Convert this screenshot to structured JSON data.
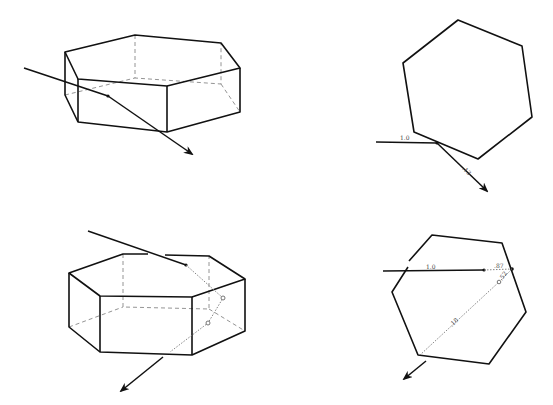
{
  "figure": {
    "panels": [
      {
        "id": "prism-3d-reflection",
        "description": "Ray striking side face of hexagonal prism and externally reflected"
      },
      {
        "id": "hexagon-top-reflection",
        "labels": {
          "incident": "1.0",
          "reflected": ".13"
        }
      },
      {
        "id": "prism-3d-refraction",
        "description": "Ray entering top face, internally reflected, exiting bottom"
      },
      {
        "id": "hexagon-top-refraction",
        "labels": {
          "incident": "1.0",
          "reflected": ".87",
          "internal1": ".52",
          "internal2": ".18"
        }
      }
    ]
  },
  "colors": {
    "line": "#111111",
    "hidden": "#888888",
    "background": "#ffffff"
  }
}
